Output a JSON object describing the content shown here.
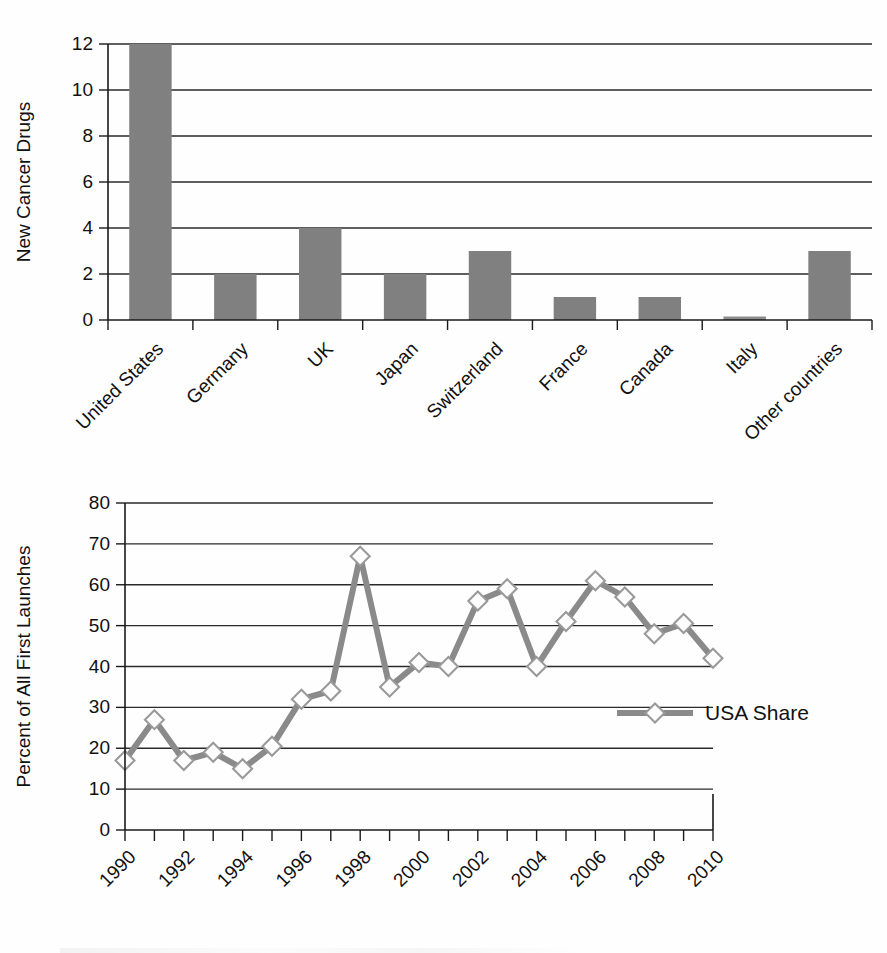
{
  "chart_data": [
    {
      "type": "bar",
      "title": "",
      "xlabel": "",
      "ylabel": "New Cancer Drugs",
      "ylim": [
        0,
        12
      ],
      "yticks": [
        0,
        2,
        4,
        6,
        8,
        10,
        12
      ],
      "grid": true,
      "legend": "none",
      "categories": [
        "United States",
        "Germany",
        "UK",
        "Japan",
        "Switzerland",
        "France",
        "Canada",
        "Italy",
        "Other countries"
      ],
      "values": [
        12,
        2,
        4,
        2,
        3,
        1,
        1,
        0,
        3
      ],
      "bar_color": "#808080"
    },
    {
      "type": "line",
      "title": "",
      "xlabel": "",
      "ylabel": "Percent of All First Launches",
      "ylim": [
        0,
        80
      ],
      "yticks": [
        0,
        10,
        20,
        30,
        40,
        50,
        60,
        70,
        80
      ],
      "xlim": [
        1990,
        2010
      ],
      "xticks": [
        1990,
        1992,
        1994,
        1996,
        1998,
        2000,
        2002,
        2004,
        2006,
        2008,
        2010
      ],
      "grid": true,
      "legend": "inside-right",
      "x": [
        1990,
        1991,
        1992,
        1993,
        1994,
        1995,
        1996,
        1997,
        1998,
        1999,
        2000,
        2001,
        2002,
        2003,
        2004,
        2005,
        2006,
        2007,
        2008,
        2009,
        2010
      ],
      "series": [
        {
          "name": "USA Share",
          "values": [
            17,
            27,
            17,
            19,
            15,
            20.5,
            32,
            34,
            67,
            35,
            41,
            40,
            56,
            59,
            40,
            51,
            61,
            57,
            48,
            50.5,
            42
          ],
          "line_color": "#8a8a8a",
          "marker": "diamond",
          "marker_fill": "#fdfdfd"
        }
      ]
    }
  ],
  "bar_chart": {
    "y_axis_title": "New Cancer Drugs",
    "y_tick_labels": [
      "0",
      "2",
      "4",
      "6",
      "8",
      "10",
      "12"
    ],
    "category_labels": [
      "United States",
      "Germany",
      "UK",
      "Japan",
      "Switzerland",
      "France",
      "Canada",
      "Italy",
      "Other countries"
    ]
  },
  "line_chart": {
    "y_axis_title": "Percent of All First Launches",
    "y_tick_labels": [
      "0",
      "10",
      "20",
      "30",
      "40",
      "50",
      "60",
      "70",
      "80"
    ],
    "x_tick_labels": [
      "1990",
      "1992",
      "1994",
      "1996",
      "1998",
      "2000",
      "2002",
      "2004",
      "2006",
      "2008",
      "2010"
    ],
    "legend": {
      "series_label": "USA Share"
    }
  },
  "colors": {
    "bar_fill": "#808080",
    "line": "#8a8a8a",
    "marker_fill": "#fdfdfd",
    "axis": "#1a1a1a"
  }
}
